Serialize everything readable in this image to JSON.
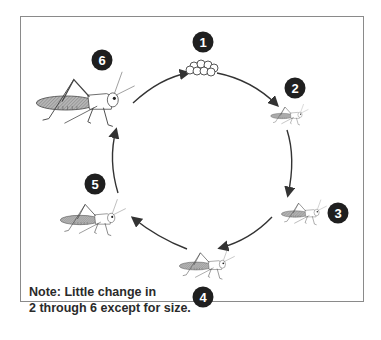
{
  "diagram": {
    "stages": [
      {
        "number": "1",
        "name": "eggs"
      },
      {
        "number": "2",
        "name": "nymph (smallest)"
      },
      {
        "number": "3",
        "name": "nymph"
      },
      {
        "number": "4",
        "name": "nymph"
      },
      {
        "number": "5",
        "name": "nymph (larger)"
      },
      {
        "number": "6",
        "name": "adult grasshopper"
      }
    ],
    "note": {
      "line1": "Note: Little change in",
      "line2": "2 through 6 except for size."
    },
    "colors": {
      "badge": "#1f1f1f",
      "line": "#333333",
      "frame": "#8a8a8a",
      "wing_fill": "#9a9a9a"
    }
  }
}
